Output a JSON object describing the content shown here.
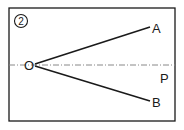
{
  "figure": {
    "number_label": "②",
    "points": {
      "O": {
        "label": "O",
        "x": 28,
        "y": 65
      },
      "A": {
        "label": "A",
        "x": 150,
        "y": 28
      },
      "B": {
        "label": "B",
        "x": 150,
        "y": 101
      },
      "P": {
        "label": "P"
      }
    },
    "rays": [
      "OA",
      "OB"
    ],
    "reference_line": {
      "style": "dash-dot",
      "through": "O",
      "direction": "horizontal",
      "label": "P"
    },
    "colors": {
      "stroke": "#1a1a1a",
      "reference": "#888888",
      "background": "#ffffff"
    }
  }
}
